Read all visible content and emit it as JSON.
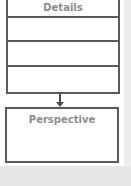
{
  "diagram": {
    "top_box": {
      "header": "Details",
      "empty_rows": 3
    },
    "arrow": {
      "direction": "down"
    },
    "bottom_box": {
      "label": "Perspective"
    }
  },
  "colors": {
    "border": "#5a5a5a",
    "text": "#8c8c8c",
    "background": "#ffffff"
  }
}
